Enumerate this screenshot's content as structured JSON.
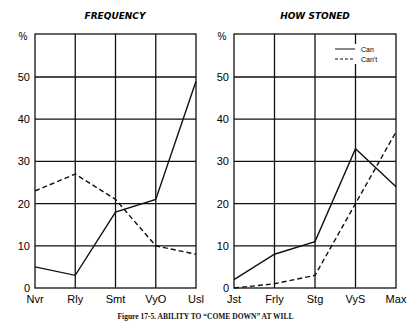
{
  "caption": "Figure 17-5. ABILITY TO “COME DOWN” AT WILL",
  "unit_symbol": "%",
  "chart_data": [
    {
      "type": "line",
      "title": "FREQUENCY",
      "xlabel": "",
      "ylabel": "%",
      "categories": [
        "Nvr",
        "Rly",
        "Smt",
        "VyO",
        "Usl"
      ],
      "yticks": [
        0,
        10,
        20,
        30,
        40,
        50
      ],
      "ylim": [
        0,
        62
      ],
      "grid": true,
      "series": [
        {
          "name": "Can",
          "style": "solid",
          "values": [
            5,
            3,
            18,
            21,
            49
          ]
        },
        {
          "name": "Can't",
          "style": "dashed",
          "values": [
            23,
            27,
            21,
            10,
            8
          ]
        }
      ]
    },
    {
      "type": "line",
      "title": "HOW STONED",
      "xlabel": "",
      "ylabel": "%",
      "categories": [
        "Jst",
        "Frly",
        "Stg",
        "VyS",
        "Max"
      ],
      "yticks": [
        0,
        10,
        20,
        30,
        40,
        50
      ],
      "ylim": [
        0,
        62
      ],
      "grid": true,
      "legend": {
        "position": "top-right",
        "entries": [
          "Can",
          "Can't"
        ]
      },
      "series": [
        {
          "name": "Can",
          "style": "solid",
          "values": [
            2,
            8,
            11,
            33,
            24
          ]
        },
        {
          "name": "Can't",
          "style": "dashed",
          "values": [
            0,
            1,
            3,
            20,
            37
          ]
        }
      ]
    }
  ]
}
